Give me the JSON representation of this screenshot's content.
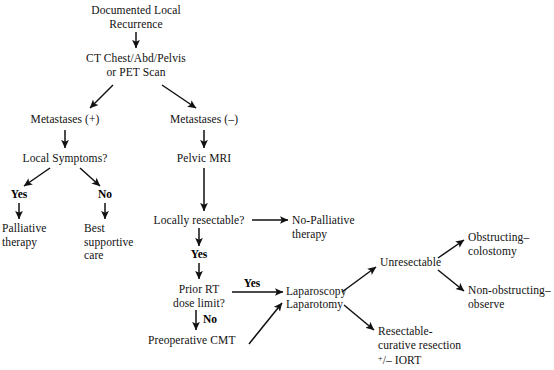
{
  "diagram": {
    "type": "flowchart",
    "background_color": "#ffffff",
    "ink_color": "#111111"
  },
  "nodes": {
    "documented_local_recurrence": "Documented Local\nRecurrence",
    "ct_or_pet": "CT Chest/Abd/Pelvis\nor PET Scan",
    "metastases_pos": "Metastases (+)",
    "metastases_neg": "Metastases (–)",
    "local_symptoms": "Local Symptoms?",
    "pelvic_mri": "Pelvic MRI",
    "palliative_therapy": "Palliative\ntherapy",
    "best_supportive_care": "Best\nsupportive\ncare",
    "locally_resectable": "Locally resectable?",
    "no_palliative_therapy": "No-Palliative\ntherapy",
    "prior_rt_dose_limit": "Prior RT\ndose limit?",
    "preoperative_cmt": "Preoperative CMT",
    "laparoscopy": "Laparoscopy",
    "laparotomy": "Laparotomy",
    "unresectable": "Unresectable",
    "obstructing_colostomy": "Obstructing–\ncolostomy",
    "non_obstructing_observe": "Non-obstructing–\nobserve",
    "resectable_curative": "Resectable-\ncurative resection",
    "iort_line_prefix": "+",
    "iort_line_rest": "/– IORT"
  },
  "edge_labels": {
    "symptoms_yes": "Yes",
    "symptoms_no": "No",
    "resectable_yes": "Yes",
    "rt_yes": "Yes",
    "rt_no": "No"
  }
}
